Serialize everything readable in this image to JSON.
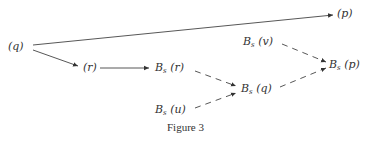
{
  "figure": {
    "caption": "Figure 3",
    "nodes": {
      "q": {
        "label": "(q)"
      },
      "p": {
        "label": "(p)"
      },
      "r": {
        "label": "(r)"
      },
      "bs_r": {
        "base": "B",
        "sub": "s",
        "arg": "(r)"
      },
      "bs_v": {
        "base": "B",
        "sub": "s",
        "arg": "(v)"
      },
      "bs_p": {
        "base": "B",
        "sub": "s",
        "arg": "(p)"
      },
      "bs_q": {
        "base": "B",
        "sub": "s",
        "arg": "(q)"
      },
      "bs_u": {
        "base": "B",
        "sub": "s",
        "arg": "(u)"
      }
    },
    "edges": [
      {
        "from": "q",
        "to": "p",
        "style": "solid"
      },
      {
        "from": "q",
        "to": "r",
        "style": "solid"
      },
      {
        "from": "r",
        "to": "bs_r",
        "style": "solid"
      },
      {
        "from": "bs_r",
        "to": "bs_q",
        "style": "dashed"
      },
      {
        "from": "bs_u",
        "to": "bs_q",
        "style": "dashed"
      },
      {
        "from": "bs_v",
        "to": "bs_p",
        "style": "dashed"
      },
      {
        "from": "bs_q",
        "to": "bs_p",
        "style": "dashed"
      }
    ],
    "colors": {
      "ink": "#333333",
      "background": "#ffffff"
    }
  }
}
